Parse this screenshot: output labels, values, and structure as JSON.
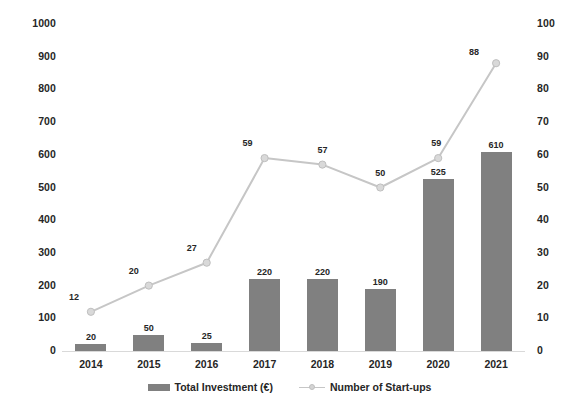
{
  "chart_data": {
    "type": "bar",
    "title": "",
    "subtitle": "",
    "xlabel": "",
    "ylabel": "",
    "grid": false,
    "legend_position": "bottom",
    "categories": [
      "2014",
      "2015",
      "2016",
      "2017",
      "2018",
      "2019",
      "2020",
      "2021"
    ],
    "series": [
      {
        "name": "Total Investment (€)",
        "type": "bar",
        "axis": "left",
        "color": "#808080",
        "values": [
          20,
          50,
          25,
          220,
          220,
          190,
          525,
          610
        ],
        "data_labels": [
          "20",
          "50",
          "25",
          "220",
          "220",
          "190",
          "525",
          "610"
        ]
      },
      {
        "name": "Number of Start-ups",
        "type": "line",
        "axis": "right",
        "color": "#c6c6c6",
        "marker_color": "#d9d9d9",
        "values": [
          12,
          20,
          27,
          59,
          57,
          50,
          59,
          88
        ],
        "data_labels": [
          "12",
          "20",
          "27",
          "59",
          "57",
          "50",
          "59",
          "88"
        ]
      }
    ],
    "y_left": {
      "label": "",
      "min": 0,
      "max": 1000,
      "step": 100,
      "ticks": [
        "0",
        "100",
        "200",
        "300",
        "400",
        "500",
        "600",
        "700",
        "800",
        "900",
        "1000"
      ]
    },
    "y_right": {
      "label": "",
      "min": 0,
      "max": 100,
      "step": 10,
      "ticks": [
        "0",
        "10",
        "20",
        "30",
        "40",
        "50",
        "60",
        "70",
        "80",
        "90",
        "100"
      ]
    },
    "x_ticks": [
      "2014",
      "2015",
      "2016",
      "2017",
      "2018",
      "2019",
      "2020",
      "2021"
    ]
  },
  "legend": {
    "items": [
      {
        "label": "Total Investment (€)",
        "marker": "bar-swatch"
      },
      {
        "label": "Number of Start-ups",
        "marker": "line-marker-swatch"
      }
    ]
  }
}
